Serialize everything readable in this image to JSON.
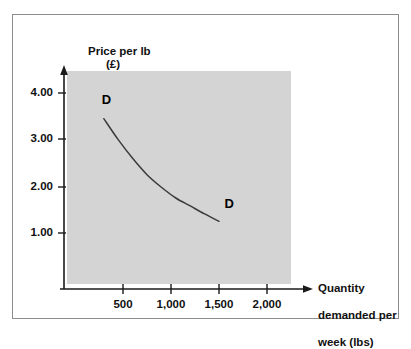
{
  "figure": {
    "clipped_caption": "",
    "background_color": "#ffffff",
    "frame_border_color": "#8d8d8d",
    "plot_fill_color": "#d4d4d4",
    "axis_color": "#1a1a1a",
    "curve_color": "#3b3b3b"
  },
  "chart_data": {
    "type": "line",
    "title": "",
    "xlabel": "Quantity demanded per week (lbs)",
    "ylabel": "Price per lb (£)",
    "ylabel_lines": [
      "Price per lb",
      "(£)"
    ],
    "xlabel_lines": [
      "Quantity",
      "demanded per",
      "week (lbs)"
    ],
    "xlim": [
      0,
      2200
    ],
    "ylim": [
      0,
      4.4
    ],
    "xticks": [
      500,
      1000,
      1500,
      2000
    ],
    "xtick_labels": [
      "500",
      "1,000",
      "1,500",
      "2,000"
    ],
    "yticks": [
      1.0,
      2.0,
      3.0,
      4.0
    ],
    "ytick_labels": [
      "1.00",
      "2.00",
      "3.00",
      "4.00"
    ],
    "grid": false,
    "legend": null,
    "series": [
      {
        "name": "D",
        "label": "D",
        "x": [
          300,
          450,
          600,
          750,
          900,
          1050,
          1200,
          1350,
          1500
        ],
        "y": [
          3.45,
          3.0,
          2.6,
          2.25,
          1.98,
          1.75,
          1.58,
          1.41,
          1.25
        ]
      }
    ],
    "annotations": [
      {
        "text": "D",
        "x": 320,
        "y": 3.85
      },
      {
        "text": "D",
        "x": 1600,
        "y": 1.62
      }
    ]
  }
}
